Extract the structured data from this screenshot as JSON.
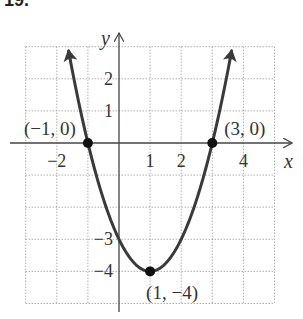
{
  "heading": "19.",
  "chart_data": {
    "type": "line",
    "title": "",
    "function": "y = x^2 - 2x - 3",
    "xlabel": "x",
    "ylabel": "y",
    "xlim": [
      -3,
      5
    ],
    "ylim": [
      -5,
      3
    ],
    "grid": true,
    "grid_style": "dotted",
    "x_tick_labels": [
      {
        "value": -2,
        "label": "−2"
      },
      {
        "value": 1,
        "label": "1"
      },
      {
        "value": 2,
        "label": "2"
      },
      {
        "value": 4,
        "label": "4"
      }
    ],
    "y_tick_labels": [
      {
        "value": 2,
        "label": "2"
      },
      {
        "value": 1,
        "label": "1"
      },
      {
        "value": -3,
        "label": "−3"
      },
      {
        "value": -4,
        "label": "−4"
      }
    ],
    "series": [
      {
        "name": "parabola",
        "x": [
          -1.6,
          -1,
          0,
          1,
          2,
          3,
          3.6
        ],
        "y": [
          2.76,
          0,
          -3,
          -4,
          -3,
          0,
          2.76
        ],
        "color": "#3a3a3a",
        "arrows": "both ends"
      }
    ],
    "points": [
      {
        "x": -1,
        "y": 0,
        "label": "(−1, 0)"
      },
      {
        "x": 3,
        "y": 0,
        "label": "(3, 0)"
      },
      {
        "x": 1,
        "y": -4,
        "label": "(1, −4)"
      }
    ],
    "legend": null
  }
}
